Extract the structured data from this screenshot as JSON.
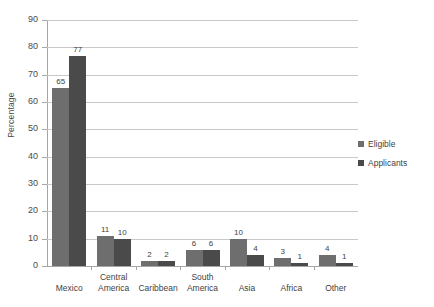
{
  "chart_data": {
    "type": "bar",
    "title": "",
    "xlabel": "",
    "ylabel": "Percentage",
    "ylim": [
      0,
      90
    ],
    "ytick_step": 10,
    "yticks": [
      0,
      10,
      20,
      30,
      40,
      50,
      60,
      70,
      80,
      90
    ],
    "grid": true,
    "legend_position": "right",
    "categories": [
      "Mexico",
      "Central\nAmerica",
      "Caribbean",
      "South\nAmerica",
      "Asia",
      "Africa",
      "Other"
    ],
    "series": [
      {
        "name": "Eligible",
        "color": "#6e6e6e",
        "values": [
          65,
          11,
          2,
          6,
          10,
          3,
          4
        ]
      },
      {
        "name": "Applicants",
        "color": "#4a4a4a",
        "values": [
          77,
          10,
          2,
          6,
          4,
          1,
          1
        ]
      }
    ]
  },
  "legend": {
    "items": [
      {
        "label": "Eligible",
        "color": "#6e6e6e"
      },
      {
        "label": "Applicants",
        "color": "#4a4a4a"
      }
    ]
  }
}
